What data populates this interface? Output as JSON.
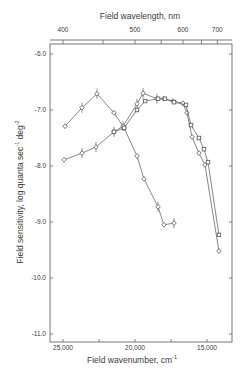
{
  "chart_data": {
    "type": "line",
    "title": "",
    "top_axis": {
      "label": "Field wavelength, nm",
      "ticks": [
        400,
        450,
        500,
        550,
        600,
        650,
        700
      ],
      "tick_labels": [
        "400",
        "500",
        "600",
        "700"
      ],
      "labeled_ticks": [
        400,
        500,
        600,
        700
      ]
    },
    "xlabel": "Field wavenumber, cm",
    "xlabel_sup": "-1",
    "ylabel": "Field sensitivity, log quanta sec",
    "ylabel_sup1": "-1",
    "ylabel_mid": " deg",
    "ylabel_sup2": "-2",
    "xlim": [
      25140,
      13050
    ],
    "ylim": [
      -11.15,
      -5.82
    ],
    "x_ticks": [
      25000,
      22500,
      20000,
      17500,
      15000
    ],
    "x_tick_labels": [
      "25,000",
      "20,000",
      "15,000"
    ],
    "x_labeled_ticks": [
      25000,
      20000,
      15000
    ],
    "y_ticks": [
      -6.0,
      -7.0,
      -8.0,
      -9.0,
      -10.0,
      -11.0
    ],
    "y_tick_labels": [
      "-6.0",
      "-7.0",
      "-8.0",
      "-9.0",
      "-10.0",
      "-11.0"
    ],
    "grid": false,
    "legend": null,
    "series": [
      {
        "name": "curve-A (blue-peaked, diamonds)",
        "marker": "diamond",
        "x": [
          24860,
          23680,
          22640,
          21460,
          20760,
          19860,
          19380,
          18400,
          17990,
          17290
        ],
        "y": [
          -7.29,
          -6.96,
          -6.71,
          -7.05,
          -7.32,
          -7.82,
          -8.23,
          -8.73,
          -9.05,
          -9.02
        ],
        "crossed": [
          false,
          true,
          true,
          false,
          false,
          false,
          false,
          true,
          false,
          true
        ]
      },
      {
        "name": "curve-B (diamonds with crosses)",
        "marker": "diamond",
        "x": [
          24930,
          23680,
          22710,
          21460,
          20830,
          19860,
          19440,
          18470,
          17990,
          17360,
          16670,
          16390,
          16040,
          15560,
          15140,
          14170
        ],
        "y": [
          -7.89,
          -7.77,
          -7.66,
          -7.39,
          -7.29,
          -6.89,
          -6.7,
          -6.8,
          -6.8,
          -6.84,
          -6.88,
          -7.05,
          -7.48,
          -7.77,
          -7.98,
          -9.52
        ],
        "crossed": [
          false,
          true,
          true,
          true,
          true,
          true,
          true,
          true,
          false,
          false,
          false,
          false,
          false,
          false,
          false,
          false
        ]
      },
      {
        "name": "curve-C (squares)",
        "marker": "square",
        "x": [
          21460,
          20760,
          19860,
          19300,
          18400,
          17920,
          17290,
          16460,
          16110,
          15560,
          15210,
          14930,
          14170
        ],
        "y": [
          -7.39,
          -7.32,
          -7.0,
          -6.84,
          -6.8,
          -6.8,
          -6.86,
          -6.91,
          -7.27,
          -7.5,
          -7.7,
          -7.93,
          -9.23
        ],
        "crossed": [
          false,
          false,
          false,
          false,
          false,
          false,
          false,
          false,
          false,
          false,
          false,
          false,
          false
        ]
      }
    ]
  }
}
